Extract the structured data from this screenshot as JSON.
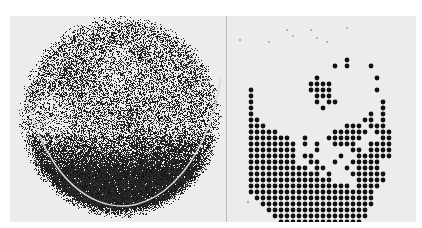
{
  "figure": {
    "description": "Two-panel grayscale figure: left a stippled circular scan image, right a dot-matrix rendition of the same pattern",
    "colors": {
      "background": "#ffffff",
      "panel": "#ececec",
      "ink": "#111111",
      "divider": "#bdbdbd"
    },
    "left_panel": {
      "type": "stipple-scan",
      "disc": {
        "cx": 110,
        "cy": 100,
        "r": 97
      },
      "dark_region": "lower third of disc",
      "arc": {
        "cx": 112,
        "cy": 20,
        "rx": 102,
        "ry": 170,
        "color": "#d8d8d8"
      },
      "dark_spots": [
        {
          "x": 62,
          "y": 58,
          "r": 24
        },
        {
          "x": 118,
          "y": 108,
          "r": 16
        },
        {
          "x": 130,
          "y": 40,
          "r": 14
        }
      ]
    },
    "right_panel": {
      "type": "dot-matrix",
      "origin": {
        "x": 24,
        "y": 44
      },
      "pitch": 6,
      "dot_radius": 2.4,
      "rows": [
        "................#.......",
        "..............#.#...#...",
        "........................",
        "...........#.........#..",
        "..........####..........",
        "#.........####.......#..",
        "#..........###..........",
        "#..........#.##.......#.",
        "#...........#.........#.",
        "#...................#.#.",
        "##.................##.#.",
        "###.............###.###.",
        "#####.........######.###",
        "#######..#...######...##",
        "########.#.#..####..####",
        "########...#.....##.####",
        "########.##....#..######",
        "########..##..#..#####..",
        "##########.##...#.####..",
        "############.#...######.",
        "##############....#####.",
        "#################.####..",
        "#####################...",
        ".####################...",
        "..###################...",
        "...#################....",
        "....################....",
        ".....##############.....",
        "......############......",
        "........##########......"
      ],
      "stray_marks": [
        {
          "x": 21,
          "y": 186
        },
        {
          "x": 13,
          "y": 24
        }
      ]
    }
  }
}
